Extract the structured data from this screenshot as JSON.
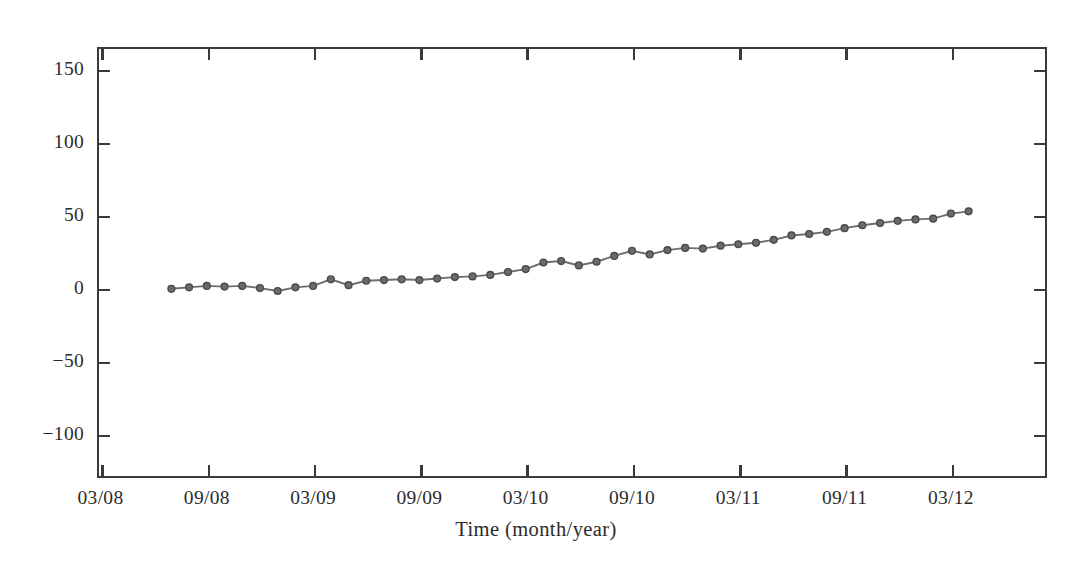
{
  "chart_data": {
    "type": "line",
    "title": "",
    "xlabel": "Time (month/year)",
    "ylabel": "Deformation (mm)",
    "ylim": [
      -130,
      165
    ],
    "yticks": [
      -100,
      -50,
      0,
      50,
      100,
      150
    ],
    "ytick_labels": [
      "−100",
      "−50",
      "0",
      "50",
      "100",
      "150"
    ],
    "xticks": [
      "03/08",
      "09/08",
      "03/09",
      "09/09",
      "03/10",
      "09/10",
      "03/11",
      "09/11",
      "03/12"
    ],
    "grid": false,
    "legend": "none",
    "marker": "circle",
    "marker_color": "#6b6b6b",
    "marker_edge_color": "#4a4a4a",
    "line_color": "#6e6e6e",
    "series": [
      {
        "name": "Deformation",
        "x": [
          "07/08",
          "08/08",
          "09/08",
          "10/08",
          "11/08",
          "12/08",
          "01/09",
          "02/09",
          "03/09",
          "04/09",
          "05/09",
          "06/09",
          "07/09",
          "08/09",
          "09/09",
          "10/09",
          "11/09",
          "12/09",
          "01/10",
          "02/10",
          "03/10",
          "04/10",
          "05/10",
          "06/10",
          "07/10",
          "08/10",
          "09/10",
          "10/10",
          "11/10",
          "12/10",
          "01/11",
          "02/11",
          "03/11",
          "04/11",
          "05/11",
          "06/11",
          "07/11",
          "08/11",
          "09/11",
          "10/11",
          "11/11",
          "12/11",
          "01/12",
          "02/12",
          "03/12",
          "04/12"
        ],
        "values": [
          -0.5,
          0.5,
          1.5,
          1.0,
          1.5,
          0.0,
          -2.0,
          0.5,
          1.5,
          6.0,
          2.0,
          5.0,
          5.5,
          6.0,
          5.5,
          6.5,
          7.5,
          8.0,
          9.0,
          11.0,
          13.0,
          17.5,
          18.5,
          15.5,
          18.0,
          22.0,
          25.5,
          23.0,
          26.0,
          27.5,
          27.0,
          29.0,
          30.0,
          31.0,
          33.0,
          36.0,
          37.0,
          38.5,
          41.0,
          43.0,
          44.5,
          46.0,
          47.0,
          47.5,
          51.0,
          52.5
        ]
      }
    ]
  },
  "axis": {
    "x_title": "Time (month/year)",
    "y_title": "Deformation (mm)"
  }
}
